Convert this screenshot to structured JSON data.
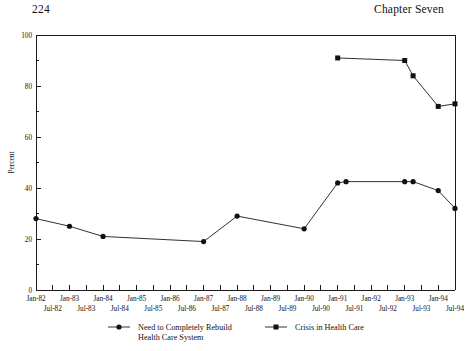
{
  "page": {
    "folio": "224",
    "running_head": "Chapter Seven"
  },
  "chart_data": {
    "type": "line",
    "title": "",
    "xlabel": "",
    "ylabel": "Percent",
    "ylim": [
      0,
      100
    ],
    "y_major_ticks": [
      0,
      20,
      40,
      60,
      80,
      100
    ],
    "y_minor_step": 10,
    "grid": false,
    "legend_position": "bottom",
    "x_tick_labels_top": [
      "Jan-82",
      "Jan-83",
      "Jan-84",
      "Jan-85",
      "Jan-86",
      "Jan-87",
      "Jan-88",
      "Jan-89",
      "Jan-90",
      "Jan-91",
      "Jan-92",
      "Jan-93",
      "Jan-94"
    ],
    "x_tick_labels_bottom": [
      "Jul-82",
      "Jul-83",
      "Jul-84",
      "Jul-85",
      "Jul-86",
      "Jul-87",
      "Jul-88",
      "Jul-89",
      "Jul-90",
      "Jul-91",
      "Jul-92",
      "Jul-93",
      "Jul-94"
    ],
    "x_range": [
      "Jan-82",
      "Jul-94"
    ],
    "series": [
      {
        "name": "Need to Completely Rebuild Health Care System",
        "marker": "circle",
        "x": [
          "Jan-82",
          "Jan-83",
          "Jan-84",
          "Jan-87",
          "Jan-88",
          "Jan-90",
          "Jan-91",
          "Apr-91",
          "Jan-93",
          "Apr-93",
          "Jan-94",
          "Jul-94"
        ],
        "values": [
          28,
          25,
          21,
          19,
          29,
          24,
          42,
          42.5,
          42.5,
          42.5,
          39,
          32
        ]
      },
      {
        "name": "Crisis in Health Care",
        "marker": "square",
        "x": [
          "Jan-91",
          "Jan-93",
          "Apr-93",
          "Jan-94",
          "Jul-94"
        ],
        "values": [
          91,
          90,
          84,
          72,
          73
        ]
      }
    ]
  },
  "legend": {
    "entries": [
      {
        "label_line1": "Need to Completely Rebuild",
        "label_line2": "Health Care System",
        "marker": "circle"
      },
      {
        "label_line1": "Crisis in Health Care",
        "label_line2": "",
        "marker": "square"
      }
    ]
  }
}
